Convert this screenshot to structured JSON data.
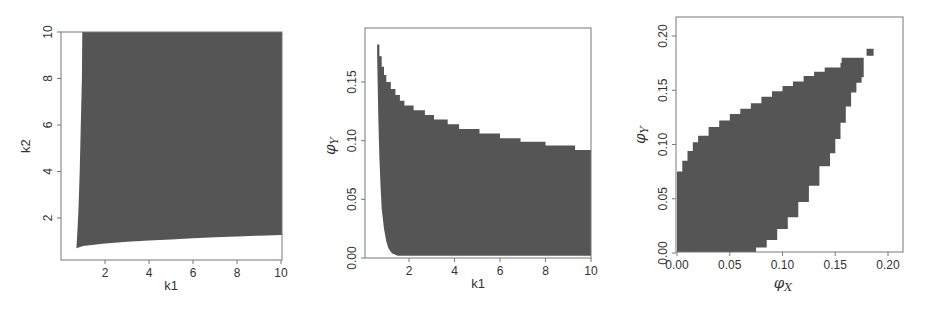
{
  "colors": {
    "fill": "#555555",
    "frame": "#777777",
    "text": "#333333",
    "background": "#ffffff"
  },
  "chart_data": [
    {
      "type": "area",
      "title": "",
      "xlabel": "k1",
      "ylabel": "k2",
      "xlim": [
        0.5,
        10
      ],
      "ylim": [
        0.3,
        10
      ],
      "xticks": [
        2,
        4,
        6,
        8,
        10
      ],
      "yticks": [
        2,
        4,
        6,
        8,
        10
      ],
      "xtick_labels": [
        "2",
        "4",
        "6",
        "8",
        "10"
      ],
      "ytick_labels": [
        "2",
        "4",
        "6",
        "8",
        "10"
      ],
      "grid": false,
      "description": "Shaded feasible region in (k1,k2): bounded left by a near-vertical curve from k1≈0.7 to k1≈1.0 and below by a slowly rising curve k2≈0.7→1.3",
      "region": {
        "upper": [
          [
            0.95,
            10
          ],
          [
            10,
            10
          ]
        ],
        "left": [
          [
            0.7,
            0.7
          ],
          [
            0.75,
            1.5
          ],
          [
            0.8,
            2.5
          ],
          [
            0.85,
            4
          ],
          [
            0.9,
            6
          ],
          [
            0.95,
            8
          ],
          [
            0.97,
            10
          ]
        ],
        "lower": [
          [
            0.7,
            0.7
          ],
          [
            1.0,
            0.8
          ],
          [
            2,
            0.9
          ],
          [
            3,
            0.98
          ],
          [
            4,
            1.03
          ],
          [
            5,
            1.08
          ],
          [
            6,
            1.13
          ],
          [
            7,
            1.17
          ],
          [
            8,
            1.21
          ],
          [
            9,
            1.24
          ],
          [
            10,
            1.27
          ]
        ]
      }
    },
    {
      "type": "area",
      "title": "",
      "xlabel": "k1",
      "ylabel": "φY",
      "xlim": [
        0.5,
        10
      ],
      "ylim": [
        0,
        0.19
      ],
      "xticks": [
        2,
        4,
        6,
        8,
        10
      ],
      "yticks": [
        0.0,
        0.05,
        0.1,
        0.15
      ],
      "xtick_labels": [
        "2",
        "4",
        "6",
        "8",
        "10"
      ],
      "ytick_labels": [
        "0.00",
        "0.05",
        "0.10",
        "0.15"
      ],
      "grid": false,
      "description": "Shaded region of attainable φY vs k1: stepped upper boundary decreasing from ≈0.18 at k1≈0.6 to ≈0.09 at k1=10; lower boundary drops steeply to 0 by k1≈1.5",
      "upper_steps": [
        [
          0.6,
          0.182
        ],
        [
          0.7,
          0.172
        ],
        [
          0.8,
          0.163
        ],
        [
          0.9,
          0.156
        ],
        [
          1.0,
          0.15
        ],
        [
          1.2,
          0.144
        ],
        [
          1.4,
          0.139
        ],
        [
          1.6,
          0.134
        ],
        [
          1.8,
          0.13
        ],
        [
          2.2,
          0.126
        ],
        [
          2.7,
          0.122
        ],
        [
          3.1,
          0.118
        ],
        [
          3.7,
          0.114
        ],
        [
          4.2,
          0.11
        ],
        [
          5.1,
          0.106
        ],
        [
          6.0,
          0.102
        ],
        [
          6.9,
          0.099
        ],
        [
          8.0,
          0.096
        ],
        [
          9.3,
          0.092
        ],
        [
          10.0,
          0.092
        ]
      ],
      "lower": [
        [
          0.6,
          0.175
        ],
        [
          0.65,
          0.12
        ],
        [
          0.7,
          0.085
        ],
        [
          0.75,
          0.06
        ],
        [
          0.8,
          0.042
        ],
        [
          0.9,
          0.025
        ],
        [
          1.0,
          0.014
        ],
        [
          1.1,
          0.008
        ],
        [
          1.25,
          0.004
        ],
        [
          1.5,
          0.002
        ],
        [
          10.0,
          0.002
        ]
      ]
    },
    {
      "type": "area",
      "title": "",
      "xlabel": "φX",
      "ylabel": "φY",
      "xlim": [
        -0.005,
        0.215
      ],
      "ylim": [
        -0.005,
        0.215
      ],
      "xticks": [
        0.0,
        0.05,
        0.1,
        0.15,
        0.2
      ],
      "yticks": [
        0.0,
        0.05,
        0.1,
        0.15,
        0.2
      ],
      "xtick_labels": [
        "0.00",
        "0.05",
        "0.10",
        "0.15",
        "0.20"
      ],
      "ytick_labels": [
        "0.00",
        "0.05",
        "0.10",
        "0.15",
        "0.20"
      ],
      "grid": false,
      "description": "Lens-shaped pixelated region of jointly attainable (φX, φY), from origin to an isolated cell at ≈(0.183, 0.185)",
      "upper": [
        [
          0.0,
          0.0
        ],
        [
          0.0,
          0.075
        ],
        [
          0.005,
          0.085
        ],
        [
          0.01,
          0.094
        ],
        [
          0.015,
          0.102
        ],
        [
          0.02,
          0.108
        ],
        [
          0.03,
          0.116
        ],
        [
          0.04,
          0.122
        ],
        [
          0.05,
          0.128
        ],
        [
          0.06,
          0.133
        ],
        [
          0.07,
          0.138
        ],
        [
          0.08,
          0.144
        ],
        [
          0.09,
          0.149
        ],
        [
          0.1,
          0.154
        ],
        [
          0.11,
          0.158
        ],
        [
          0.12,
          0.163
        ],
        [
          0.13,
          0.167
        ],
        [
          0.14,
          0.171
        ],
        [
          0.155,
          0.175
        ],
        [
          0.156,
          0.18
        ],
        [
          0.177,
          0.18
        ]
      ],
      "lower": [
        [
          0.0,
          0.0
        ],
        [
          0.075,
          0.0
        ],
        [
          0.085,
          0.005
        ],
        [
          0.095,
          0.012
        ],
        [
          0.105,
          0.022
        ],
        [
          0.115,
          0.033
        ],
        [
          0.125,
          0.047
        ],
        [
          0.135,
          0.062
        ],
        [
          0.145,
          0.08
        ],
        [
          0.15,
          0.092
        ],
        [
          0.155,
          0.105
        ],
        [
          0.16,
          0.12
        ],
        [
          0.165,
          0.135
        ],
        [
          0.17,
          0.148
        ],
        [
          0.175,
          0.157
        ],
        [
          0.177,
          0.162
        ],
        [
          0.177,
          0.18
        ]
      ],
      "isolated_point": [
        0.183,
        0.185
      ]
    }
  ]
}
